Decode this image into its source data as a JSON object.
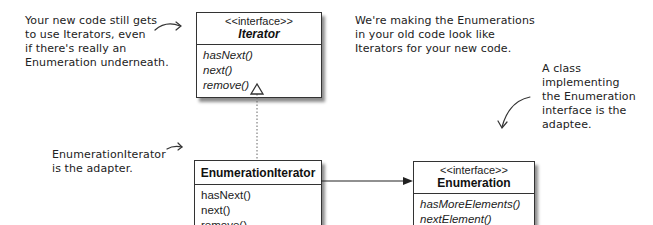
{
  "notes": {
    "client": "Your new code still gets\nto use Iterators, even\nif there's really an\nEnumeration underneath.",
    "goal": "We're making the Enumerations\nin your old code look like\nIterators for your new code.",
    "adaptee": "A class\nimplementing\nthe Enumeration\ninterface is the\nadaptee.",
    "adapter": "EnumerationIterator\nis the adapter."
  },
  "classes": {
    "iterator": {
      "stereotype": "<<interface>>",
      "name": "Iterator",
      "methods": [
        "hasNext()",
        "next()",
        "remove()"
      ]
    },
    "enumeration_iterator": {
      "name": "EnumerationIterator",
      "methods": [
        "hasNext()",
        "next()",
        "remove()"
      ]
    },
    "enumeration": {
      "stereotype": "<<interface>>",
      "name": "Enumeration",
      "methods": [
        "hasMoreElements()",
        "nextElement()"
      ]
    }
  },
  "relationships": [
    {
      "from": "EnumerationIterator",
      "to": "Iterator",
      "type": "realization"
    },
    {
      "from": "EnumerationIterator",
      "to": "Enumeration",
      "type": "association"
    }
  ]
}
